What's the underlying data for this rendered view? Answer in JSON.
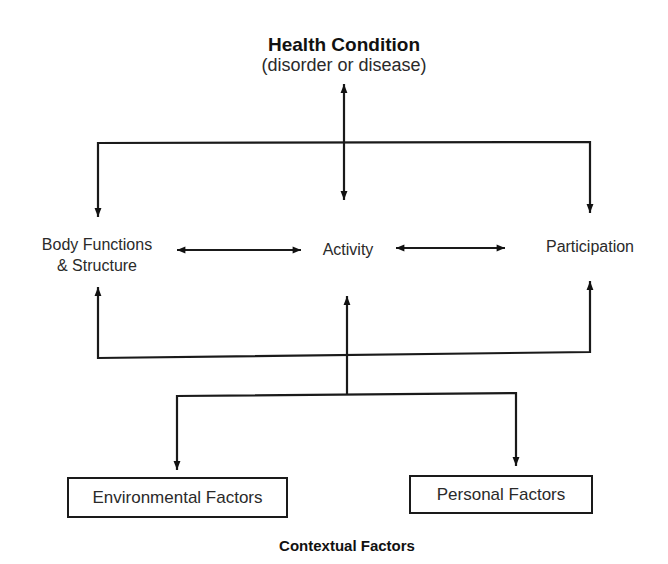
{
  "diagram": {
    "title": "Health Condition",
    "subtitle": "(disorder or disease)",
    "nodes": {
      "body": {
        "line1": "Body Functions",
        "line2": "& Structure"
      },
      "activity": "Activity",
      "participation": "Participation"
    },
    "boxes": {
      "environmental": "Environmental Factors",
      "personal": "Personal Factors"
    },
    "footer": "Contextual Factors",
    "colors": {
      "line": "#1a1a1a",
      "background": "#ffffff",
      "text": "#2a2a2a"
    },
    "connections": [
      {
        "from": "Health Condition",
        "to": "Activity",
        "type": "bidirectional"
      },
      {
        "from": "Health Condition",
        "to": "Body Functions & Structure",
        "type": "directed"
      },
      {
        "from": "Health Condition",
        "to": "Participation",
        "type": "directed"
      },
      {
        "from": "Body Functions & Structure",
        "to": "Activity",
        "type": "bidirectional"
      },
      {
        "from": "Activity",
        "to": "Participation",
        "type": "bidirectional"
      },
      {
        "from": "Contextual Factors",
        "to": "Body Functions & Structure",
        "type": "directed"
      },
      {
        "from": "Contextual Factors",
        "to": "Activity",
        "type": "directed"
      },
      {
        "from": "Contextual Factors",
        "to": "Participation",
        "type": "directed"
      },
      {
        "from": "Contextual Factors",
        "to": "Environmental Factors",
        "type": "directed"
      },
      {
        "from": "Contextual Factors",
        "to": "Personal Factors",
        "type": "directed"
      }
    ]
  }
}
